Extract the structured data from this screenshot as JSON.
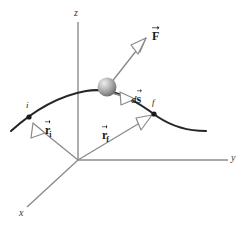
{
  "figure": {
    "background_color": "#ffffff"
  },
  "axes": {
    "x_label": "x",
    "y_label": "y",
    "z_label": "z",
    "color": "#8c8c8c",
    "origin": {
      "x": 78,
      "y": 160
    }
  },
  "path": {
    "name": "particle-trajectory",
    "color": "#262626",
    "start_label": "i",
    "end_label": "f"
  },
  "particle": {
    "name": "particle-sphere",
    "color_light": "#e8e8e8",
    "color_mid": "#9a9a9a",
    "color_dark": "#6b6b6b"
  },
  "vectors": [
    {
      "id": "force",
      "symbol": "F",
      "subscript": "",
      "italic_prefix": "",
      "description": "force vector"
    },
    {
      "id": "displacement",
      "symbol": "s",
      "subscript": "",
      "italic_prefix": "d",
      "description": "infinitesimal displacement vector"
    },
    {
      "id": "position-initial",
      "symbol": "r",
      "subscript": "i",
      "italic_prefix": "",
      "description": "initial position vector"
    },
    {
      "id": "position-final",
      "symbol": "r",
      "subscript": "f",
      "italic_prefix": "",
      "description": "final position vector"
    }
  ],
  "arrow_style": {
    "fill": "#ffffff",
    "stroke": "#8a8a8a",
    "shaft_color": "#8a8a8a"
  }
}
